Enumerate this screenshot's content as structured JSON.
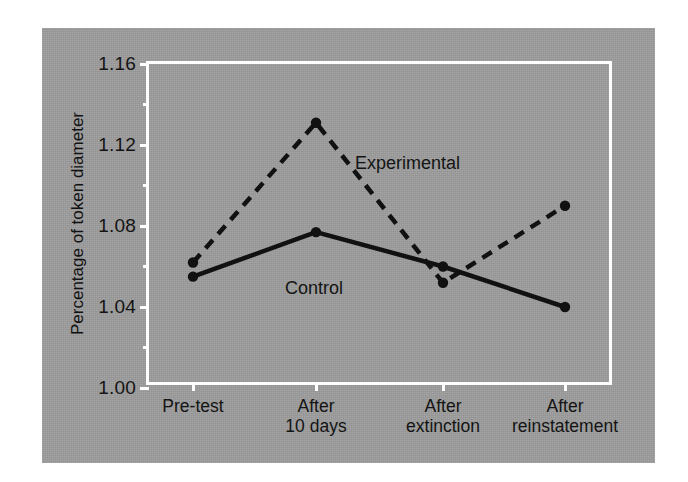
{
  "figure": {
    "background_color": "#9d9d9d",
    "frame_color": "#ffffff",
    "ink_color": "#111111"
  },
  "chart_data": {
    "type": "line",
    "title": "",
    "xlabel": "",
    "ylabel": "Percentage of token diameter",
    "categories": [
      "Pre-test",
      "After\n10 days",
      "After\nextinction",
      "After\nreinstatement"
    ],
    "ylim": [
      1.0,
      1.16
    ],
    "ytick_labels": [
      "1.00",
      "1.04",
      "1.08",
      "1.12",
      "1.16"
    ],
    "ytick_values": [
      1.0,
      1.04,
      1.08,
      1.12,
      1.16
    ],
    "yminor_values": [
      1.02,
      1.06,
      1.1,
      1.14
    ],
    "grid": false,
    "legend": "inline-annotations",
    "series": [
      {
        "name": "Experimental",
        "style": "dashed",
        "marker": "filled-circle",
        "color": "#111111",
        "values": [
          1.062,
          1.131,
          1.052,
          1.09
        ]
      },
      {
        "name": "Control",
        "style": "solid",
        "marker": "filled-circle",
        "color": "#111111",
        "values": [
          1.055,
          1.077,
          1.06,
          1.04
        ]
      }
    ]
  },
  "annotations": {
    "experimental_label": "Experimental",
    "control_label": "Control"
  }
}
